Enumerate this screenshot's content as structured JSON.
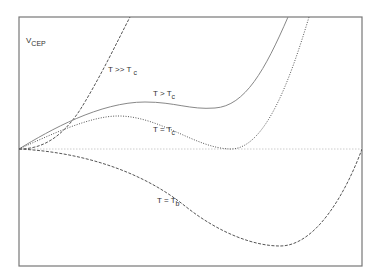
{
  "chart_data": {
    "type": "line",
    "title": "",
    "ylabel": "V_CEP",
    "xlabel": "",
    "grid": false,
    "legend": "inline labels on curves",
    "frame": {
      "left": 19,
      "top": 17,
      "right": 362,
      "bottom": 266
    },
    "baseline_y": 149,
    "series": [
      {
        "name": "T >> T_c",
        "label_main": "T >> T",
        "label_sub": "c",
        "style": "dashed",
        "color": "#555555",
        "path": "M19,149 C40,149 60,140 80,110 C100,78 118,40 130,17",
        "label_pos": {
          "x": 108,
          "y": 66
        }
      },
      {
        "name": "T > T_c",
        "label_main": "T > T",
        "label_sub": "c",
        "style": "solid",
        "color": "#888888",
        "path": "M19,149 C50,130 100,102 145,102 C175,102 190,110 215,108 C245,106 265,70 288,17",
        "label_pos": {
          "x": 153,
          "y": 90
        }
      },
      {
        "name": "T = T_c",
        "label_main": "T = T",
        "label_sub": "c",
        "style": "dotted",
        "color": "#555555",
        "path": "M19,149 C50,135 90,116 118,116 C160,116 195,148 230,149 C265,150 290,80 309,17",
        "label_pos": {
          "x": 153,
          "y": 126
        }
      },
      {
        "name": "T = T_b",
        "label_main": "T = T",
        "label_sub": "b",
        "style": "dashed",
        "color": "#555555",
        "path": "M19,149 C80,152 140,170 185,206 C220,234 255,246 280,246 C315,246 345,195 362,149",
        "label_pos": {
          "x": 157,
          "y": 197
        }
      }
    ],
    "annotations": [
      {
        "text": "V_CEP",
        "main": "V",
        "sub": "CEP",
        "x": 26,
        "y": 37
      }
    ]
  }
}
